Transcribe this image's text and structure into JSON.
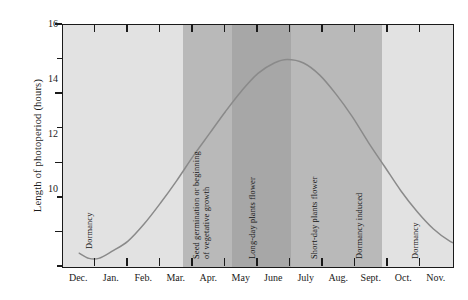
{
  "chart_data": {
    "type": "line",
    "title": "",
    "xlabel": "",
    "ylabel": "Length of photoperiod (hours)",
    "ylim": [
      9,
      16
    ],
    "ytick_major": [
      10,
      12,
      14,
      16
    ],
    "ytick_minor": [
      9,
      11,
      13,
      15
    ],
    "ytick_labels": [
      "10",
      "12",
      "14",
      "16"
    ],
    "grid": false,
    "legend": "none",
    "categories": [
      "Dec.",
      "Jan.",
      "Feb.",
      "Mar.",
      "Apr.",
      "May",
      "June",
      "July",
      "Aug.",
      "Sept.",
      "Oct.",
      "Nov."
    ],
    "series": [
      {
        "name": "Photoperiod",
        "color": "#8a8a8a",
        "values": [
          9.35,
          9.25,
          10.05,
          11.4,
          12.8,
          14.1,
          14.95,
          14.8,
          13.85,
          12.5,
          11.1,
          10.0
        ]
      }
    ],
    "points": [
      {
        "x": 0.0,
        "y": 9.4
      },
      {
        "x": 0.3,
        "y": 9.25
      },
      {
        "x": 0.6,
        "y": 9.25
      },
      {
        "x": 1.0,
        "y": 9.45
      },
      {
        "x": 1.5,
        "y": 9.75
      },
      {
        "x": 2.0,
        "y": 10.25
      },
      {
        "x": 2.5,
        "y": 10.85
      },
      {
        "x": 3.0,
        "y": 11.5
      },
      {
        "x": 3.5,
        "y": 12.2
      },
      {
        "x": 4.0,
        "y": 12.85
      },
      {
        "x": 4.5,
        "y": 13.5
      },
      {
        "x": 5.0,
        "y": 14.1
      },
      {
        "x": 5.5,
        "y": 14.6
      },
      {
        "x": 6.0,
        "y": 14.9
      },
      {
        "x": 6.4,
        "y": 15.0
      },
      {
        "x": 6.9,
        "y": 14.9
      },
      {
        "x": 7.4,
        "y": 14.55
      },
      {
        "x": 7.9,
        "y": 14.0
      },
      {
        "x": 8.4,
        "y": 13.35
      },
      {
        "x": 8.9,
        "y": 12.6
      },
      {
        "x": 9.4,
        "y": 11.9
      },
      {
        "x": 9.9,
        "y": 11.2
      },
      {
        "x": 10.4,
        "y": 10.6
      },
      {
        "x": 10.9,
        "y": 10.1
      },
      {
        "x": 11.4,
        "y": 9.75
      },
      {
        "x": 11.9,
        "y": 9.55
      }
    ],
    "bands": [
      {
        "label": "Dormancy",
        "start": 0,
        "end": 3.7,
        "color": "#e2e2e2"
      },
      {
        "label": "Seed germination or beginning\nof vegetative growth",
        "start": 3.7,
        "end": 5.2,
        "color": "#b9b9b9"
      },
      {
        "label": "Long-day plants flower",
        "start": 5.2,
        "end": 7.0,
        "color": "#a7a7a7"
      },
      {
        "label": "Short-day plants flower",
        "start": 7.0,
        "end": 8.5,
        "color": "#b9b9b9"
      },
      {
        "label": "Dormancy induced",
        "start": 8.5,
        "end": 9.8,
        "color": "#b9b9b9"
      },
      {
        "label": "Dormancy",
        "start": 9.8,
        "end": 12.0,
        "color": "#e2e2e2"
      }
    ],
    "annotations": [
      {
        "text": "Dormancy",
        "at_month": 0.75,
        "lines": 1
      },
      {
        "text": "Seed germination or beginning",
        "at_month": 4.0,
        "lines": 2
      },
      {
        "text": "of vegetative growth",
        "at_month": 4.0,
        "lines": 2
      },
      {
        "text": "Long-day plants flower",
        "at_month": 6.0,
        "lines": 1
      },
      {
        "text": "Short-day plants flower",
        "at_month": 7.8,
        "lines": 1
      },
      {
        "text": "Dormancy induced",
        "at_month": 9.2,
        "lines": 1
      },
      {
        "text": "Dormancy",
        "at_month": 10.8,
        "lines": 1
      }
    ]
  },
  "axis": {
    "y_title": "Length of photoperiod (hours)",
    "y_labels": [
      "16",
      "14",
      "12",
      "10"
    ],
    "x_labels": [
      "Dec.",
      "Jan.",
      "Feb.",
      "Mar.",
      "Apr.",
      "May",
      "June",
      "July",
      "Aug.",
      "Sept.",
      "Oct.",
      "Nov."
    ]
  },
  "band_labels": {
    "dormancy_winter": "Dormancy",
    "germination_line1": "Seed germination or beginning",
    "germination_line2": "of vegetative growth",
    "long_day": "Long-day plants flower",
    "short_day": "Short-day plants flower",
    "dormancy_induced": "Dormancy induced",
    "dormancy_autumn": "Dormancy"
  },
  "colors": {
    "band_light": "#e2e2e2",
    "band_medium": "#b9b9b9",
    "band_dark": "#a7a7a7",
    "curve": "#8a8a8a",
    "axis": "#1a1a1a",
    "background": "#ffffff"
  }
}
